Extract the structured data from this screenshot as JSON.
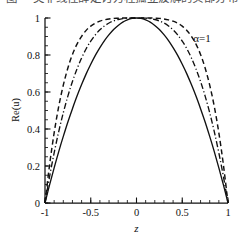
{
  "caption_strip": {
    "name": "cut-off-figure-caption",
    "text": "图 一类非线性薛定谔方程孤立波解的实部分布"
  },
  "figure": {
    "background_color": "#ffffff",
    "ink_color": "#111111"
  },
  "chart_data": {
    "type": "line",
    "title": "",
    "xlabel": "z",
    "ylabel": "Re(u)",
    "xlim": [
      -1,
      1
    ],
    "ylim": [
      0,
      1
    ],
    "grid": false,
    "legend": "none",
    "x_ticks": [
      -1,
      -0.5,
      0,
      0.5,
      1
    ],
    "x_tick_labels": [
      "-1",
      "-0.5",
      "0",
      "0.5",
      "1"
    ],
    "x_minor_step": 0.1,
    "y_ticks": [
      0,
      0.2,
      0.4,
      0.6,
      0.8,
      1
    ],
    "y_tick_labels": [
      "0",
      "0.2",
      "0.4",
      "0.6",
      "0.8",
      "1"
    ],
    "y_minor_step": 0.05,
    "annotations": [
      {
        "name": "alpha-annotation",
        "text": "α=1",
        "x": 0.62,
        "y": 0.97
      }
    ],
    "series": [
      {
        "name": "solid-curve",
        "style": "solid",
        "color": "#111111",
        "exponent": 2.0,
        "x": [
          -1,
          -0.95,
          -0.9,
          -0.85,
          -0.8,
          -0.75,
          -0.7,
          -0.65,
          -0.6,
          -0.55,
          -0.5,
          -0.45,
          -0.4,
          -0.35,
          -0.3,
          -0.25,
          -0.2,
          -0.15,
          -0.1,
          -0.05,
          0,
          0.05,
          0.1,
          0.15,
          0.2,
          0.25,
          0.3,
          0.35,
          0.4,
          0.45,
          0.5,
          0.55,
          0.6,
          0.65,
          0.7,
          0.75,
          0.8,
          0.85,
          0.9,
          0.95,
          1
        ],
        "values": [
          0,
          0.098,
          0.19,
          0.278,
          0.36,
          0.438,
          0.51,
          0.578,
          0.64,
          0.698,
          0.75,
          0.798,
          0.84,
          0.878,
          0.91,
          0.938,
          0.96,
          0.978,
          0.99,
          0.998,
          1,
          0.998,
          0.99,
          0.978,
          0.96,
          0.938,
          0.91,
          0.878,
          0.84,
          0.798,
          0.75,
          0.698,
          0.64,
          0.578,
          0.51,
          0.438,
          0.36,
          0.278,
          0.19,
          0.098,
          0
        ]
      },
      {
        "name": "dash-dot-curve",
        "style": "dashdot",
        "color": "#111111",
        "exponent": 3.0,
        "x": [
          -1,
          -0.95,
          -0.9,
          -0.85,
          -0.8,
          -0.75,
          -0.7,
          -0.65,
          -0.6,
          -0.55,
          -0.5,
          -0.45,
          -0.4,
          -0.35,
          -0.3,
          -0.25,
          -0.2,
          -0.15,
          -0.1,
          -0.05,
          0,
          0.05,
          0.1,
          0.15,
          0.2,
          0.25,
          0.3,
          0.35,
          0.4,
          0.45,
          0.5,
          0.55,
          0.6,
          0.65,
          0.7,
          0.75,
          0.8,
          0.85,
          0.9,
          0.95,
          1
        ],
        "values": [
          0,
          0.143,
          0.271,
          0.386,
          0.488,
          0.578,
          0.657,
          0.725,
          0.784,
          0.834,
          0.875,
          0.909,
          0.936,
          0.957,
          0.973,
          0.984,
          0.992,
          0.997,
          0.999,
          1.0,
          1,
          1.0,
          0.999,
          0.997,
          0.992,
          0.984,
          0.973,
          0.957,
          0.936,
          0.909,
          0.875,
          0.834,
          0.784,
          0.725,
          0.657,
          0.578,
          0.488,
          0.386,
          0.271,
          0.143,
          0
        ]
      },
      {
        "name": "dashed-curve",
        "style": "dashed",
        "color": "#111111",
        "exponent": 4.5,
        "x": [
          -1,
          -0.95,
          -0.9,
          -0.85,
          -0.8,
          -0.75,
          -0.7,
          -0.65,
          -0.6,
          -0.55,
          -0.5,
          -0.45,
          -0.4,
          -0.35,
          -0.3,
          -0.25,
          -0.2,
          -0.15,
          -0.1,
          -0.05,
          0,
          0.05,
          0.1,
          0.15,
          0.2,
          0.25,
          0.3,
          0.35,
          0.4,
          0.45,
          0.5,
          0.55,
          0.6,
          0.65,
          0.7,
          0.75,
          0.8,
          0.85,
          0.9,
          0.95,
          1
        ],
        "values": [
          0,
          0.206,
          0.379,
          0.522,
          0.637,
          0.73,
          0.803,
          0.859,
          0.901,
          0.933,
          0.956,
          0.972,
          0.983,
          0.99,
          0.995,
          0.998,
          0.999,
          1.0,
          1.0,
          1.0,
          1,
          1.0,
          1.0,
          1.0,
          0.999,
          0.998,
          0.995,
          0.99,
          0.983,
          0.972,
          0.956,
          0.933,
          0.901,
          0.859,
          0.803,
          0.73,
          0.637,
          0.522,
          0.379,
          0.206,
          0
        ]
      }
    ]
  }
}
